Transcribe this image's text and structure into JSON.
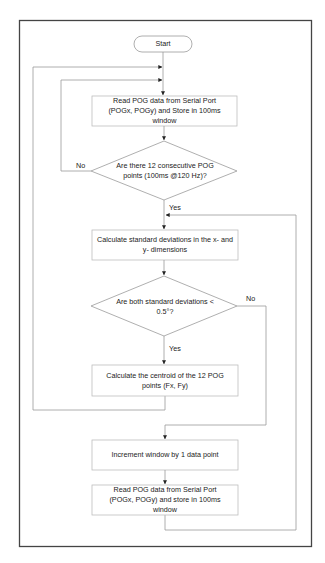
{
  "diagram": {
    "type": "flowchart",
    "frame": {
      "stroke": "#444444"
    },
    "colors": {
      "line": "#9a9a9a",
      "box_border": "#bdbdbd",
      "text": "#222222",
      "frame": "#444444"
    },
    "nodes": {
      "start": {
        "shape": "terminator",
        "label": "Start"
      },
      "read1": {
        "shape": "process",
        "label": "Read POG data from Serial Port (POGx, POGy) and Store in 100ms window"
      },
      "check12": {
        "shape": "decision",
        "label": "Are there 12 consecutive POG points (100ms @120 Hz)?"
      },
      "calcsd": {
        "shape": "process",
        "label": "Calculate standard deviations in the x- and y- dimensions"
      },
      "checksd": {
        "shape": "decision",
        "label": "Are both standard deviations < 0.5°?"
      },
      "centroid": {
        "shape": "process",
        "label": "Calculate the centroid of the 12 POG points (Fx, Fy)"
      },
      "increment": {
        "shape": "process",
        "label": "Increment window by 1 data point"
      },
      "read2": {
        "shape": "process",
        "label": "Read POG data from Serial Port (POGx, POGy) and store in 100ms window"
      }
    },
    "edge_labels": {
      "check12_no": "No",
      "check12_yes": "Yes",
      "checksd_no": "No",
      "checksd_yes": "Yes"
    },
    "edges": [
      {
        "from": "start",
        "to": "read1"
      },
      {
        "from": "read1",
        "to": "check12"
      },
      {
        "from": "check12",
        "to": "read1",
        "label": "No"
      },
      {
        "from": "check12",
        "to": "calcsd",
        "label": "Yes"
      },
      {
        "from": "calcsd",
        "to": "checksd"
      },
      {
        "from": "checksd",
        "to": "centroid",
        "label": "Yes"
      },
      {
        "from": "checksd",
        "to": "increment",
        "label": "No"
      },
      {
        "from": "centroid",
        "to": "read1"
      },
      {
        "from": "increment",
        "to": "read2"
      },
      {
        "from": "read2",
        "to": "calcsd"
      }
    ]
  }
}
